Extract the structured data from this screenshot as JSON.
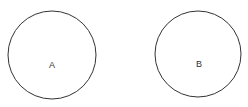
{
  "diagram": {
    "circles": [
      {
        "label": "A",
        "cx": 52,
        "cy": 55,
        "r": 44
      },
      {
        "label": "B",
        "cx": 198,
        "cy": 54,
        "r": 43
      }
    ],
    "stroke_color": "#333333"
  }
}
